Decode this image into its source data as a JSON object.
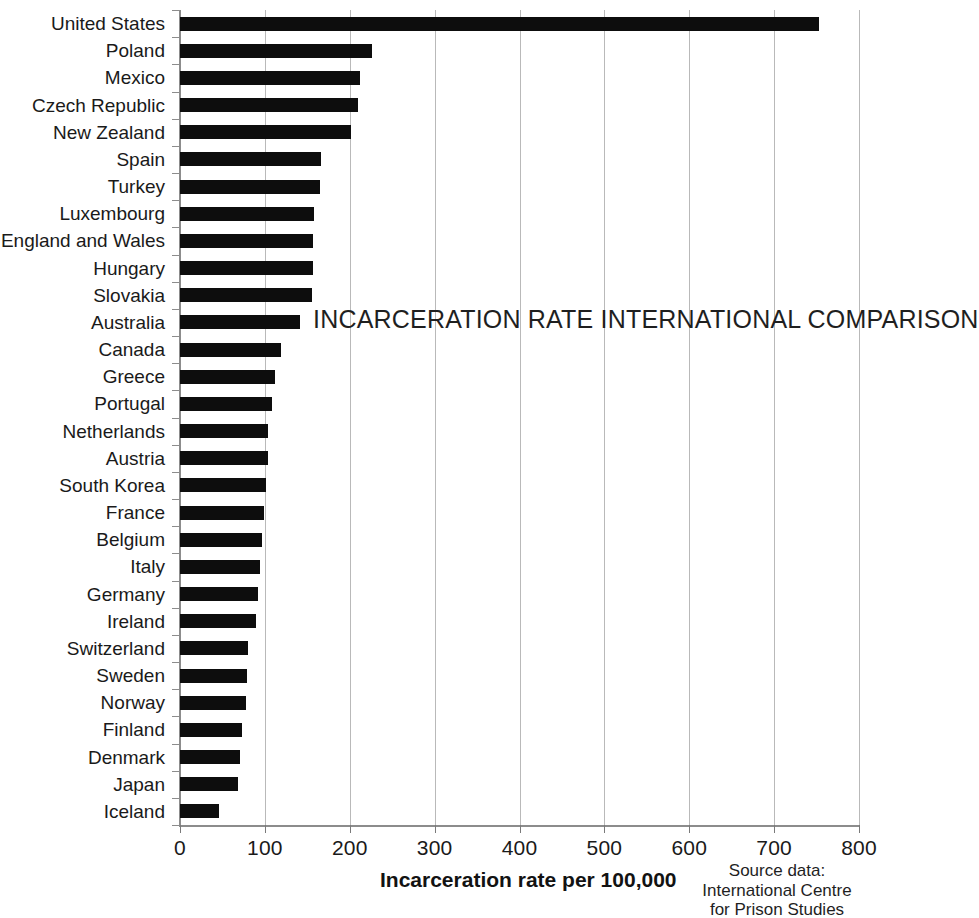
{
  "chart_data": {
    "type": "bar",
    "orientation": "horizontal",
    "title": "INCARCERATION RATE INTERNATIONAL COMPARISON",
    "xlabel": "Incarceration rate per 100,000",
    "ylabel": "",
    "xlim": [
      0,
      800
    ],
    "xticks": [
      0,
      100,
      200,
      300,
      400,
      500,
      600,
      700,
      800
    ],
    "xtick_labels": [
      "0",
      "100",
      "200",
      "300",
      "400",
      "500",
      "600",
      "700",
      "800"
    ],
    "grid": "vertical",
    "legend": "none",
    "bar_color": "#0d0d0d",
    "categories": [
      "United States",
      "Poland",
      "Mexico",
      "Czech Republic",
      "New Zealand",
      "Spain",
      "Turkey",
      "Luxembourg",
      "England and Wales",
      "Hungary",
      "Slovakia",
      "Australia",
      "Canada",
      "Greece",
      "Portugal",
      "Netherlands",
      "Austria",
      "South Korea",
      "France",
      "Belgium",
      "Italy",
      "Germany",
      "Ireland",
      "Switzerland",
      "Sweden",
      "Norway",
      "Finland",
      "Denmark",
      "Japan",
      "Iceland"
    ],
    "values": [
      753,
      226,
      212,
      210,
      201,
      166,
      165,
      158,
      157,
      157,
      156,
      141,
      119,
      112,
      108,
      104,
      104,
      101,
      99,
      97,
      94,
      92,
      90,
      80,
      79,
      78,
      73,
      71,
      68,
      46
    ],
    "annotations": [
      "Source data:",
      "International Centre",
      "for Prison Studies"
    ]
  },
  "source": {
    "line1": "Source data:",
    "line2": "International Centre",
    "line3": "for Prison Studies"
  }
}
